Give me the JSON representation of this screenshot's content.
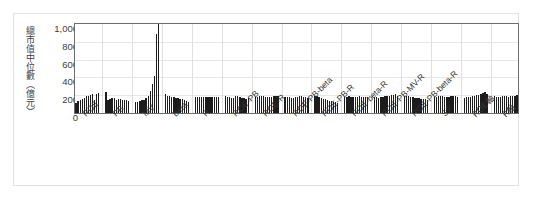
{
  "chart_data": {
    "type": "bar",
    "title": "",
    "xlabel": "",
    "ylabel": "總市值中位數（億元）",
    "ylim": [
      0,
      1000
    ],
    "yticks": [
      "0",
      "200",
      "400",
      "600",
      "800",
      "1,000"
    ],
    "ytick_values": [
      0,
      200,
      400,
      600,
      800,
      1000
    ],
    "grid": true,
    "legend": "none",
    "categories": [
      "ROE",
      "PB",
      "MV",
      "beta",
      "R",
      "ROE-PB",
      "ROE-R",
      "ROE-PB-beta",
      "ROE-PB-R",
      "ROE-beta-R",
      "ROE-PB-MV-R",
      "ROE-PB-beta-R",
      "SF",
      "ROE軸",
      "R軸"
    ],
    "groups": [
      {
        "label": "ROE",
        "values": [
          118,
          132,
          150,
          158,
          172,
          186,
          196,
          206,
          214,
          150,
          212,
          220
        ]
      },
      {
        "label": "PB",
        "values": [
          236,
          150,
          158,
          168,
          172,
          150,
          162,
          156,
          150,
          148,
          146,
          140
        ]
      },
      {
        "label": "MV",
        "values": [
          124,
          128,
          132,
          142,
          150,
          168,
          196,
          246,
          330,
          420,
          890,
          1000
        ]
      },
      {
        "label": "beta",
        "values": [
          212,
          196,
          188,
          182,
          176,
          170,
          168,
          162,
          158,
          150,
          140,
          126
        ]
      },
      {
        "label": "R",
        "values": [
          176,
          178,
          180,
          182,
          184,
          180,
          178,
          176,
          178,
          180,
          182,
          184
        ]
      },
      {
        "label": "ROE-PB",
        "values": [
          186,
          182,
          176,
          170,
          168,
          186,
          190,
          178,
          172,
          166,
          160,
          174
        ]
      },
      {
        "label": "ROE-R",
        "values": [
          178,
          182,
          186,
          190,
          188,
          184,
          180,
          176,
          182,
          186,
          190,
          196
        ]
      },
      {
        "label": "ROE-PB-beta",
        "values": [
          180,
          184,
          176,
          170,
          174,
          178,
          182,
          186,
          190,
          184,
          178,
          172
        ]
      },
      {
        "label": "ROE-PB-R",
        "values": [
          196,
          186,
          176,
          168,
          160,
          152,
          144,
          138,
          132,
          126,
          120,
          114
        ]
      },
      {
        "label": "ROE-beta-R",
        "values": [
          178,
          182,
          186,
          182,
          178,
          180,
          184,
          188,
          184,
          180,
          176,
          180
        ]
      },
      {
        "label": "ROE-PB-MV-R",
        "values": [
          182,
          178,
          174,
          178,
          182,
          186,
          190,
          194,
          200,
          206,
          212,
          196
        ]
      },
      {
        "label": "ROE-PB-beta-R",
        "values": [
          186,
          190,
          186,
          182,
          178,
          174,
          170,
          166,
          162,
          158,
          154,
          150
        ]
      },
      {
        "label": "SF",
        "values": [
          178,
          182,
          186,
          190,
          186,
          182,
          178,
          182,
          186,
          190,
          186,
          182
        ]
      },
      {
        "label": "ROE軸",
        "values": [
          172,
          176,
          180,
          184,
          188,
          192,
          200,
          208,
          216,
          224,
          232,
          214
        ]
      },
      {
        "label": "R軸",
        "values": [
          186,
          182,
          178,
          182,
          186,
          190,
          186,
          182,
          186,
          190,
          194,
          198
        ]
      }
    ]
  }
}
